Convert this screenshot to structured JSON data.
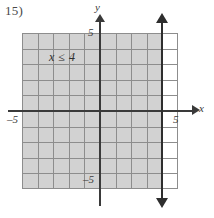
{
  "problem": {
    "number_label": "15)"
  },
  "graph": {
    "inequality_label": "x ≤ 4",
    "axis_labels": {
      "x": "x",
      "y": "y"
    },
    "tick_labels": {
      "x_min": "–5",
      "x_max": "5",
      "y_min": "–5",
      "y_max": "5"
    },
    "colors": {
      "shaded_region": "#d2d2d2",
      "gridline": "#8d8d8d",
      "axis": "#3a3a3a",
      "boundary_line": "#2e2e2e",
      "background": "#ffffff"
    }
  },
  "chart_data": {
    "type": "line",
    "title": "",
    "xlabel": "x",
    "ylabel": "y",
    "xlim": [
      -5,
      5
    ],
    "ylim": [
      -5,
      5
    ],
    "grid": true,
    "xticks": [
      -5,
      5
    ],
    "yticks": [
      -5,
      5
    ],
    "boundary_line": {
      "equation": "x = 4",
      "style": "solid",
      "arrows": "both",
      "x_value": 4
    },
    "shaded_region": {
      "inequality": "x ≤ 4",
      "direction": "left",
      "x_from": -5,
      "x_to": 4,
      "y_from": -5,
      "y_to": 5
    },
    "annotations": [
      {
        "text": "x ≤ 4",
        "x": -3,
        "y": 3.8
      }
    ]
  }
}
